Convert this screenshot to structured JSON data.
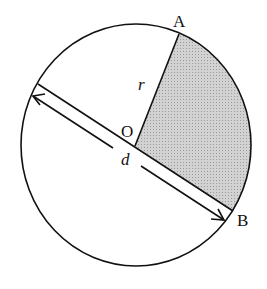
{
  "diagram": {
    "type": "circle-sector",
    "labels": {
      "point_a": "A",
      "point_b": "B",
      "center": "O",
      "radius": "r",
      "diameter": "d"
    },
    "colors": {
      "stroke": "#111111",
      "sector_fill": "#c8c8c8",
      "background": "#ffffff"
    }
  }
}
